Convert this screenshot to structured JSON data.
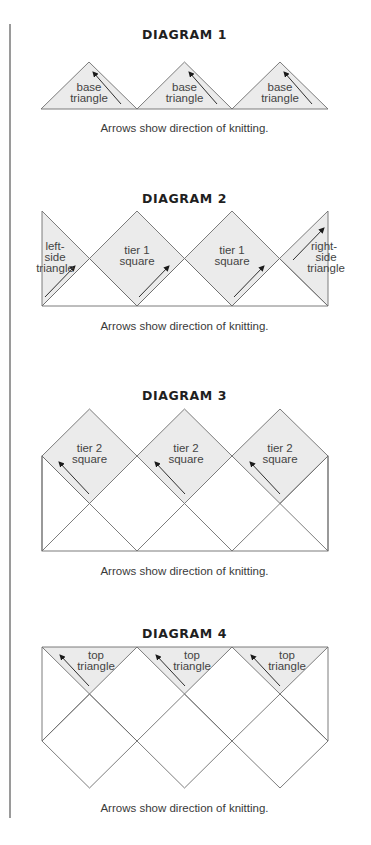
{
  "colors": {
    "shade": "#ebebeb",
    "line": "#6e6e6e",
    "arrow": "#1a1a1a",
    "rule": "#9a9a9a"
  },
  "diagrams": [
    {
      "title": "DIAGRAM 1",
      "caption": "Arrows show direction of knitting.",
      "pieces": [
        {
          "line1": "base",
          "line2": "triangle"
        },
        {
          "line1": "base",
          "line2": "triangle"
        },
        {
          "line1": "base",
          "line2": "triangle"
        }
      ]
    },
    {
      "title": "DIAGRAM 2",
      "caption": "Arrows show direction of knitting.",
      "pieces": [
        {
          "line1": "left-",
          "line2": "side",
          "line3": "triangle"
        },
        {
          "line1": "tier 1",
          "line2": "square"
        },
        {
          "line1": "tier 1",
          "line2": "square"
        },
        {
          "line1": "right-",
          "line2": "side",
          "line3": "triangle"
        }
      ]
    },
    {
      "title": "DIAGRAM 3",
      "caption": "Arrows show direction of knitting.",
      "pieces": [
        {
          "line1": "tier 2",
          "line2": "square"
        },
        {
          "line1": "tier 2",
          "line2": "square"
        },
        {
          "line1": "tier 2",
          "line2": "square"
        }
      ]
    },
    {
      "title": "DIAGRAM 4",
      "caption": "Arrows show direction of knitting.",
      "pieces": [
        {
          "line1": "top",
          "line2": "triangle"
        },
        {
          "line1": "top",
          "line2": "triangle"
        },
        {
          "line1": "top",
          "line2": "triangle"
        }
      ]
    }
  ]
}
